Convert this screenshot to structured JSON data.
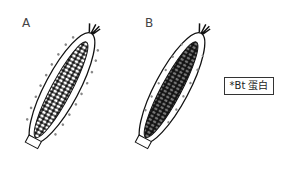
{
  "figure": {
    "panels": [
      {
        "label": "A",
        "description": "Corn ear with Bt protein (dots) distributed only on the outer husk surface; kernels white"
      },
      {
        "label": "B",
        "description": "Corn ear with Bt protein (dots) distributed inside the husk and throughout dark kernels"
      }
    ],
    "legend": {
      "symbol": "*",
      "text": "Bt 蛋白",
      "full": "*Bt 蛋白"
    }
  }
}
